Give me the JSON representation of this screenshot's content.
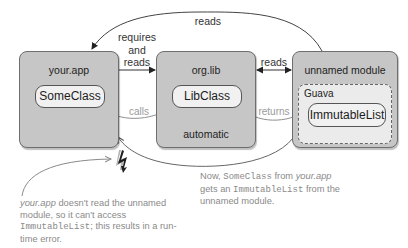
{
  "modules": [
    {
      "id": "your-app",
      "title": "your.app",
      "class": "SomeClass"
    },
    {
      "id": "org-lib",
      "title": "org.lib",
      "class": "LibClass",
      "footer": "automatic"
    },
    {
      "id": "unnamed",
      "title": "unnamed module",
      "inner_group": "Guava",
      "class": "ImmutableList"
    }
  ],
  "edges": {
    "top_reads": "reads",
    "requires_reads": [
      "requires",
      "and",
      "reads"
    ],
    "lib_unnamed_reads": "reads",
    "calls": "calls",
    "returns": "returns"
  },
  "notes": {
    "left": {
      "part1_italic": "your.app",
      "part2": " doesn't read the unnamed module, so it can't access ",
      "part3_mono": "ImmutableList",
      "part4": "; this results in a run-time error."
    },
    "right": {
      "part1": "Now, ",
      "part2_mono": "SomeClass",
      "part3": " from ",
      "part4_italic": "your.app",
      "part5": " gets an ",
      "part6_mono": "ImmutableList",
      "part7": " from the unnamed module."
    }
  },
  "icons": {
    "error": "lightning-bolt-icon"
  },
  "colors": {
    "module_fill": "#c6c6c6",
    "class_fill": "#f1f1f1",
    "guava_fill": "#ebebeb",
    "note_text": "#8a8a8a"
  }
}
